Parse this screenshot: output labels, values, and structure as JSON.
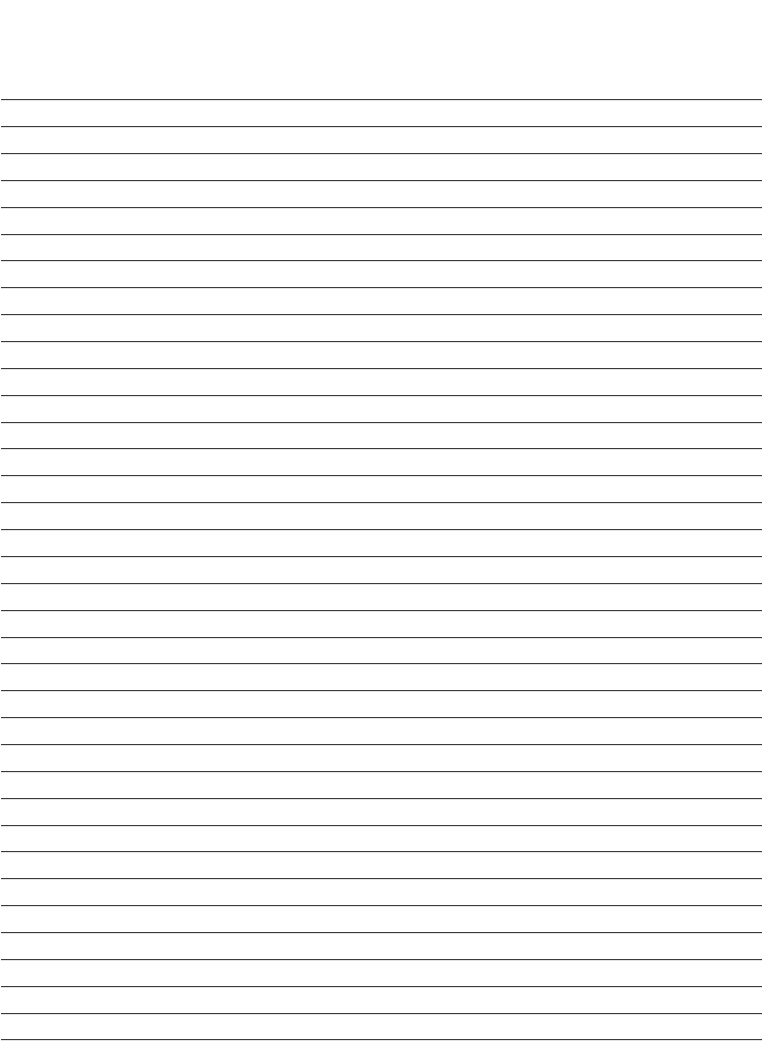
{
  "page": {
    "type": "lined-paper",
    "background_color": "#ffffff",
    "line_color": "#3a3a3a",
    "line_count": 36,
    "first_line_y": 99.3,
    "line_spacing": 26.86,
    "line_left": 1,
    "line_right": 762
  }
}
